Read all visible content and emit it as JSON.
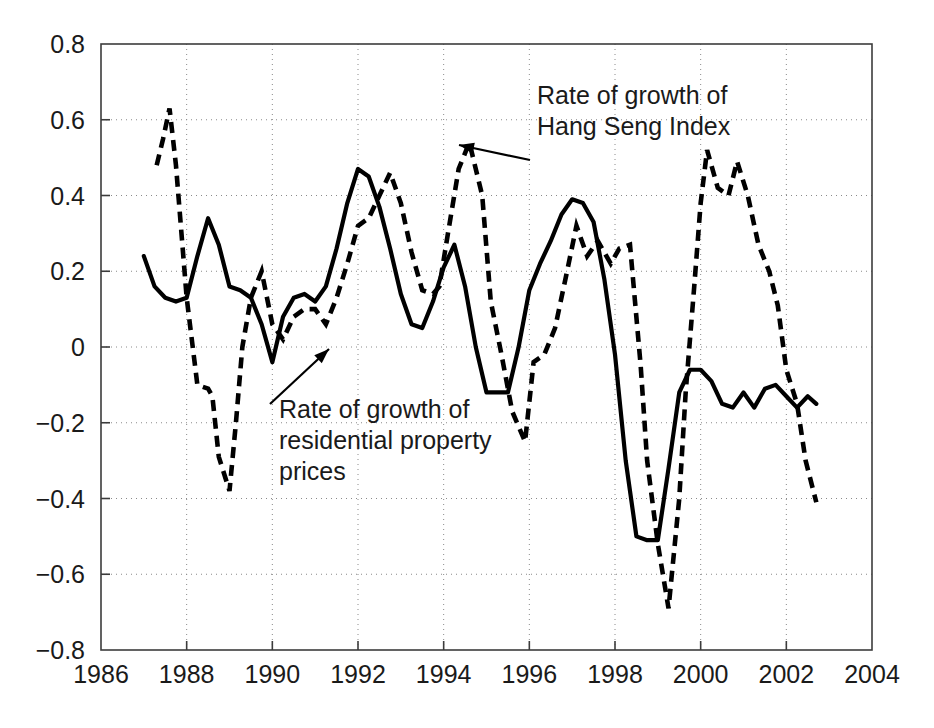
{
  "chart_data": {
    "type": "line",
    "title": "",
    "subtitle": "",
    "xlabel": "",
    "ylabel": "",
    "xlim": [
      1986,
      2004
    ],
    "ylim": [
      -0.8,
      0.8
    ],
    "grid": true,
    "legend_position": "inline-annotations",
    "x_ticks": [
      "1986",
      "1988",
      "1990",
      "1992",
      "1994",
      "1996",
      "1998",
      "2000",
      "2002",
      "2004"
    ],
    "x_tick_values": [
      1986,
      1988,
      1990,
      1992,
      1994,
      1996,
      1998,
      2000,
      2002,
      2004
    ],
    "y_ticks": [
      "0.8",
      "0.6",
      "0.4",
      "0.2",
      "0",
      "−0.2",
      "−0.4",
      "−0.6",
      "−0.8"
    ],
    "y_tick_values": [
      0.8,
      0.6,
      0.4,
      0.2,
      0,
      -0.2,
      -0.4,
      -0.6,
      -0.8
    ],
    "series": [
      {
        "name": "Rate of growth of residential property prices",
        "style": "solid",
        "color": "#000000",
        "x": [
          1987.0,
          1987.25,
          1987.5,
          1987.75,
          1988.0,
          1988.25,
          1988.5,
          1988.75,
          1989.0,
          1989.25,
          1989.5,
          1989.75,
          1990.0,
          1990.25,
          1990.5,
          1990.75,
          1991.0,
          1991.25,
          1991.5,
          1991.75,
          1992.0,
          1992.25,
          1992.5,
          1992.75,
          1993.0,
          1993.25,
          1993.5,
          1993.75,
          1994.0,
          1994.25,
          1994.5,
          1994.75,
          1995.0,
          1995.25,
          1995.5,
          1995.75,
          1996.0,
          1996.25,
          1996.5,
          1996.75,
          1997.0,
          1997.25,
          1997.5,
          1997.75,
          1998.0,
          1998.25,
          1998.5,
          1998.75,
          1999.0,
          1999.25,
          1999.5,
          1999.75,
          2000.0,
          2000.25,
          2000.5,
          2000.75,
          2001.0,
          2001.25,
          2001.5,
          2001.75,
          2002.0,
          2002.25,
          2002.5,
          2002.7
        ],
        "y": [
          0.24,
          0.16,
          0.13,
          0.12,
          0.13,
          0.24,
          0.34,
          0.27,
          0.16,
          0.15,
          0.13,
          0.06,
          -0.04,
          0.08,
          0.13,
          0.14,
          0.12,
          0.16,
          0.26,
          0.38,
          0.47,
          0.45,
          0.37,
          0.26,
          0.14,
          0.06,
          0.05,
          0.12,
          0.21,
          0.27,
          0.16,
          0.0,
          -0.12,
          -0.12,
          -0.12,
          0.0,
          0.15,
          0.22,
          0.28,
          0.35,
          0.39,
          0.38,
          0.33,
          0.18,
          -0.02,
          -0.3,
          -0.5,
          -0.51,
          -0.51,
          -0.32,
          -0.12,
          -0.06,
          -0.06,
          -0.09,
          -0.15,
          -0.16,
          -0.12,
          -0.16,
          -0.11,
          -0.1,
          -0.13,
          -0.16,
          -0.13,
          -0.15
        ]
      },
      {
        "name": "Rate of growth of Hang Seng Index",
        "style": "dashed",
        "color": "#000000",
        "x": [
          1987.3,
          1987.45,
          1987.6,
          1987.75,
          1988.0,
          1988.25,
          1988.5,
          1988.6,
          1988.75,
          1989.0,
          1989.15,
          1989.3,
          1989.5,
          1989.75,
          1990.0,
          1990.25,
          1990.5,
          1990.75,
          1991.0,
          1991.25,
          1991.5,
          1991.75,
          1992.0,
          1992.25,
          1992.5,
          1992.75,
          1993.0,
          1993.25,
          1993.5,
          1993.75,
          1993.9,
          1994.1,
          1994.35,
          1994.6,
          1994.9,
          1995.1,
          1995.35,
          1995.6,
          1995.9,
          1996.1,
          1996.35,
          1996.6,
          1996.9,
          1997.1,
          1997.35,
          1997.6,
          1997.9,
          1998.1,
          1998.35,
          1998.6,
          1998.75,
          1999.0,
          1999.25,
          1999.5,
          1999.65,
          1999.85,
          2000.0,
          2000.15,
          2000.4,
          2000.65,
          2000.85,
          2001.1,
          2001.35,
          2001.6,
          2001.8,
          2002.0,
          2002.25,
          2002.45,
          2002.7
        ],
        "y": [
          0.48,
          0.55,
          0.63,
          0.48,
          0.13,
          -0.1,
          -0.11,
          -0.13,
          -0.29,
          -0.38,
          -0.2,
          0.0,
          0.13,
          0.2,
          0.06,
          0.02,
          0.08,
          0.1,
          0.1,
          0.06,
          0.13,
          0.22,
          0.32,
          0.34,
          0.4,
          0.46,
          0.38,
          0.25,
          0.15,
          0.14,
          0.16,
          0.3,
          0.47,
          0.54,
          0.4,
          0.12,
          -0.02,
          -0.17,
          -0.25,
          -0.04,
          -0.02,
          0.05,
          0.21,
          0.32,
          0.24,
          0.28,
          0.22,
          0.26,
          0.27,
          -0.05,
          -0.3,
          -0.52,
          -0.69,
          -0.4,
          -0.12,
          0.16,
          0.38,
          0.52,
          0.42,
          0.4,
          0.49,
          0.4,
          0.27,
          0.2,
          0.11,
          -0.06,
          -0.15,
          -0.3,
          -0.41
        ]
      }
    ],
    "annotations": [
      {
        "id": "hang-seng-annotation",
        "lines": [
          "Rate of growth of",
          "Hang Seng Index"
        ],
        "text_x": 537,
        "text_y": 104,
        "arrow_from": [
          530,
          160
        ],
        "arrow_to": [
          459,
          145
        ],
        "target_series": "Rate of growth of Hang Seng Index"
      },
      {
        "id": "property-prices-annotation",
        "lines": [
          "Rate of growth of",
          "residential property",
          "prices"
        ],
        "text_x": 279,
        "text_y": 418,
        "arrow_from": [
          270,
          404
        ],
        "arrow_to": [
          329,
          349
        ],
        "target_series": "Rate of growth of residential property prices"
      }
    ]
  },
  "layout": {
    "plot_left": 101,
    "plot_right": 872,
    "plot_top": 44,
    "plot_bottom": 650,
    "background": "#ffffff",
    "axis_color": "#3c3c3c",
    "grid_color": "#8a8a8a",
    "line_color": "#000000"
  }
}
